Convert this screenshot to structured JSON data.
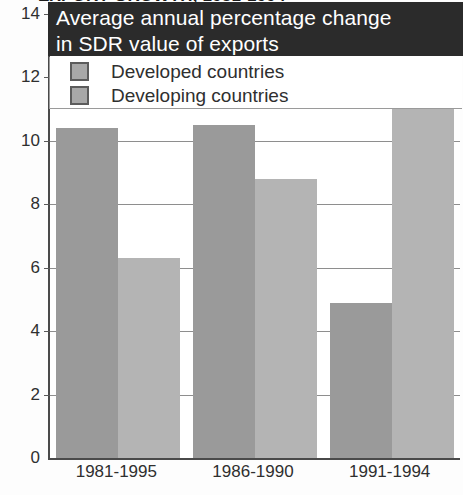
{
  "cropped_headline": "EXPORT GROWTH, 1981-1994",
  "title": {
    "line1": "Average annual percentage change",
    "line2": "in SDR value of exports"
  },
  "legend": {
    "items": [
      {
        "label": "Developed countries",
        "color": "#9a9a9a",
        "key": "developed"
      },
      {
        "label": "Developing countries",
        "color": "#b4b4b4",
        "key": "developing"
      }
    ]
  },
  "colors": {
    "developed": "#9a9a9a",
    "developing": "#b4b4b4",
    "title_background": "#2b2b2b",
    "title_text": "#ffffff",
    "axis": "#4a4a4a",
    "gridline": "#8e8e8e",
    "page_background": "#ffffff"
  },
  "chart_data": {
    "type": "bar",
    "title": "Average annual percentage change in SDR value of exports",
    "xlabel": "",
    "ylabel": "",
    "ylim": [
      0,
      14
    ],
    "yticks": [
      0,
      2,
      4,
      6,
      8,
      10,
      12,
      14
    ],
    "ytick_labels": [
      "0",
      "2",
      "4",
      "6",
      "8",
      "10",
      "12",
      "14"
    ],
    "grid": true,
    "legend_position": "top-left",
    "categories": [
      "1981-1995",
      "1986-1990",
      "1991-1994"
    ],
    "series": [
      {
        "name": "Developed countries",
        "color": "#9a9a9a",
        "values": [
          10.4,
          10.5,
          4.9
        ]
      },
      {
        "name": "Developing countries",
        "color": "#b4b4b4",
        "values": [
          6.3,
          8.8,
          12.2
        ]
      }
    ]
  }
}
